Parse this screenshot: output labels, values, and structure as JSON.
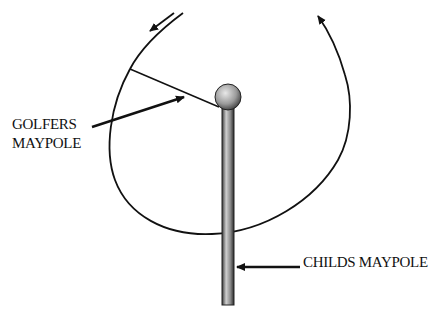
{
  "diagram": {
    "type": "maypole swing path illustration",
    "labels": {
      "golfers_line1": "GOLFERS",
      "golfers_line2": "MAYPOLE",
      "childs": "CHILDS MAYPOLE"
    },
    "elements": {
      "pole": {
        "x": 222,
        "y": 108,
        "width": 12,
        "height": 197
      },
      "ball": {
        "cx": 228,
        "cy": 97,
        "r": 13
      },
      "swing_path": "circular arc around pole with arrowheads showing rotation direction"
    },
    "colors": {
      "ink": "#111111",
      "background": "#ffffff"
    }
  }
}
